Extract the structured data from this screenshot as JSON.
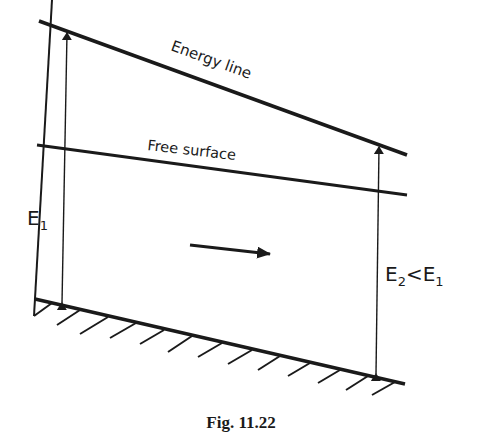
{
  "diagram": {
    "labels": {
      "energy_line": "Energy line",
      "free_surface": "Free surface",
      "e1": "E",
      "e1_sub": "1",
      "e2": "E",
      "e2_sub": "2",
      "lt": "<",
      "e2_rhs": "E",
      "e2_rhs_sub": "1"
    },
    "caption": "Fig. 11.22",
    "colors": {
      "stroke": "#1a1a1a",
      "background": "#ffffff"
    }
  }
}
